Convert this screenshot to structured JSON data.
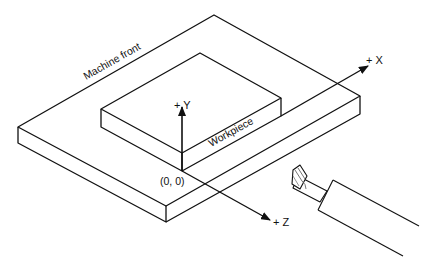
{
  "diagram": {
    "colors": {
      "stroke": "#111111",
      "background": "#ffffff",
      "tool_shading": "#888888"
    },
    "labels": {
      "machine_front": "Machine front",
      "workpiece": "Workpiece",
      "origin": "(0, 0)",
      "axis_x": "+ X",
      "axis_y": "+ Y",
      "axis_z": "+ Z"
    },
    "elements": [
      {
        "id": "machine-table",
        "type": "isometric-slab"
      },
      {
        "id": "workpiece-block",
        "type": "isometric-block"
      },
      {
        "id": "x-axis",
        "direction": "+X",
        "type": "arrow"
      },
      {
        "id": "y-axis",
        "direction": "+Y",
        "type": "arrow"
      },
      {
        "id": "z-axis",
        "direction": "+Z",
        "type": "arrow"
      },
      {
        "id": "cutting-tool",
        "type": "end-mill"
      }
    ]
  }
}
